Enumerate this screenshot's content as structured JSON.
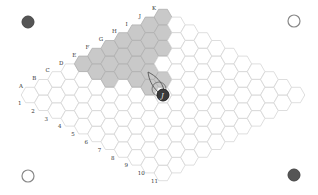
{
  "game": {
    "type": "hex-board",
    "size": 11,
    "columns": [
      "A",
      "B",
      "C",
      "D",
      "E",
      "F",
      "G",
      "H",
      "I",
      "J",
      "K"
    ],
    "rows": [
      "1",
      "2",
      "3",
      "4",
      "5",
      "6",
      "7",
      "8",
      "9",
      "10",
      "11"
    ],
    "shaded_cells": [
      "E1",
      "E2",
      "E3",
      "F1",
      "F2",
      "F3",
      "F4",
      "F5",
      "G1",
      "G2",
      "G3",
      "G4",
      "G5",
      "H1",
      "H2",
      "H3",
      "I1",
      "I2",
      "I3",
      "J1",
      "J2",
      "K1"
    ],
    "piece": {
      "cell": "F6",
      "label": "J",
      "color": "#3a3a3a"
    },
    "corners": {
      "top_left": "dark",
      "top_right": "light",
      "bottom_left": "light",
      "bottom_right": "dark"
    },
    "colors": {
      "shaded": "#c9c9c9",
      "dark": "#555555",
      "grid": "#d6d6d6"
    }
  }
}
